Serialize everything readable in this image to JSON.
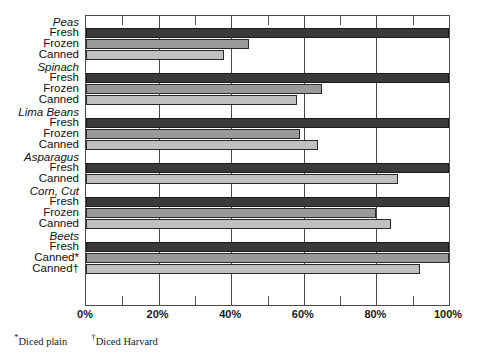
{
  "chart_data": {
    "type": "bar",
    "orientation": "horizontal",
    "title": "",
    "xlabel": "",
    "ylabel": "",
    "xlim": [
      0,
      100
    ],
    "xticks": [
      0,
      20,
      40,
      60,
      80,
      100
    ],
    "xticklabels": [
      "0%",
      "20%",
      "40%",
      "60%",
      "80%",
      "100%"
    ],
    "minor_ticks": [
      10,
      30,
      50,
      70,
      90
    ],
    "grid": true,
    "legend": "none",
    "value_unit": "%",
    "groups": [
      {
        "name": "Peas",
        "rows": [
          {
            "label": "Fresh",
            "series": "fresh",
            "value": 100
          },
          {
            "label": "Frozen",
            "series": "frozen",
            "value": 45
          },
          {
            "label": "Canned",
            "series": "canned",
            "value": 38
          }
        ]
      },
      {
        "name": "Spinach",
        "rows": [
          {
            "label": "Fresh",
            "series": "fresh",
            "value": 100
          },
          {
            "label": "Frozen",
            "series": "frozen",
            "value": 65
          },
          {
            "label": "Canned",
            "series": "canned",
            "value": 58
          }
        ]
      },
      {
        "name": "Lima Beans",
        "rows": [
          {
            "label": "Fresh",
            "series": "fresh",
            "value": 100
          },
          {
            "label": "Frozen",
            "series": "frozen",
            "value": 59
          },
          {
            "label": "Canned",
            "series": "canned",
            "value": 64
          }
        ]
      },
      {
        "name": "Asparagus",
        "rows": [
          {
            "label": "Fresh",
            "series": "fresh",
            "value": 100
          },
          {
            "label": "Canned",
            "series": "canned",
            "value": 86
          }
        ]
      },
      {
        "name": "Corn, Cut",
        "rows": [
          {
            "label": "Fresh",
            "series": "fresh",
            "value": 100
          },
          {
            "label": "Frozen",
            "series": "frozen",
            "value": 80
          },
          {
            "label": "Canned",
            "series": "canned",
            "value": 84
          }
        ]
      },
      {
        "name": "Beets",
        "rows": [
          {
            "label": "Fresh",
            "series": "fresh",
            "value": 100
          },
          {
            "label": "Canned*",
            "series": "frozen",
            "value": 100
          },
          {
            "label": "Canned†",
            "series": "canned",
            "value": 92
          }
        ]
      }
    ],
    "series_colors": {
      "fresh": "#3a3a3a",
      "frozen": "#9a9a9a",
      "canned": "#c0c0c0"
    }
  },
  "footnotes": [
    {
      "mark": "*",
      "text": "Diced plain"
    },
    {
      "mark": "†",
      "text": "Diced Harvard"
    }
  ]
}
